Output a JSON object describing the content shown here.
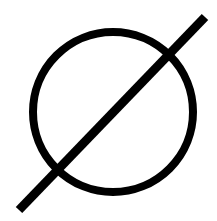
{
  "icon": {
    "name": "empty-set-icon",
    "stroke_color": "#000000",
    "background_color": "#ffffff",
    "circle": {
      "cx": 113,
      "cy": 112,
      "r": 80,
      "stroke_width": 8
    },
    "slash": {
      "x1": 19,
      "y1": 210,
      "x2": 205,
      "y2": 17,
      "stroke_width": 9
    }
  }
}
